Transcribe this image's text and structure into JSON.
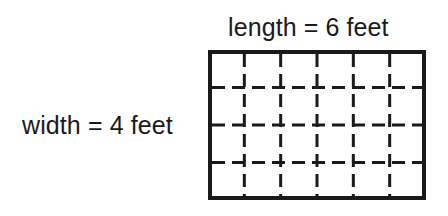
{
  "figure": {
    "background_color": "#ffffff",
    "ink_color": "#1a1a1a",
    "length_label": "length = 6 feet",
    "width_label": "width = 4 feet",
    "rectangle": {
      "columns": 6,
      "rows": 4,
      "length_value": 6,
      "width_value": 4,
      "unit": "feet",
      "area_square_units": 24,
      "border_color": "#1a1a1a",
      "border_width_px": 4,
      "grid_line_color": "#1a1a1a",
      "grid_line_width_px": 3,
      "grid_line_style": "dashed",
      "x": 208,
      "y": 50,
      "width_px": 218,
      "height_px": 150,
      "vertical_grid_x": [
        36.33,
        72.67,
        109,
        145.33,
        181.67
      ],
      "horizontal_grid_y": [
        37.5,
        75,
        112.5
      ]
    }
  }
}
